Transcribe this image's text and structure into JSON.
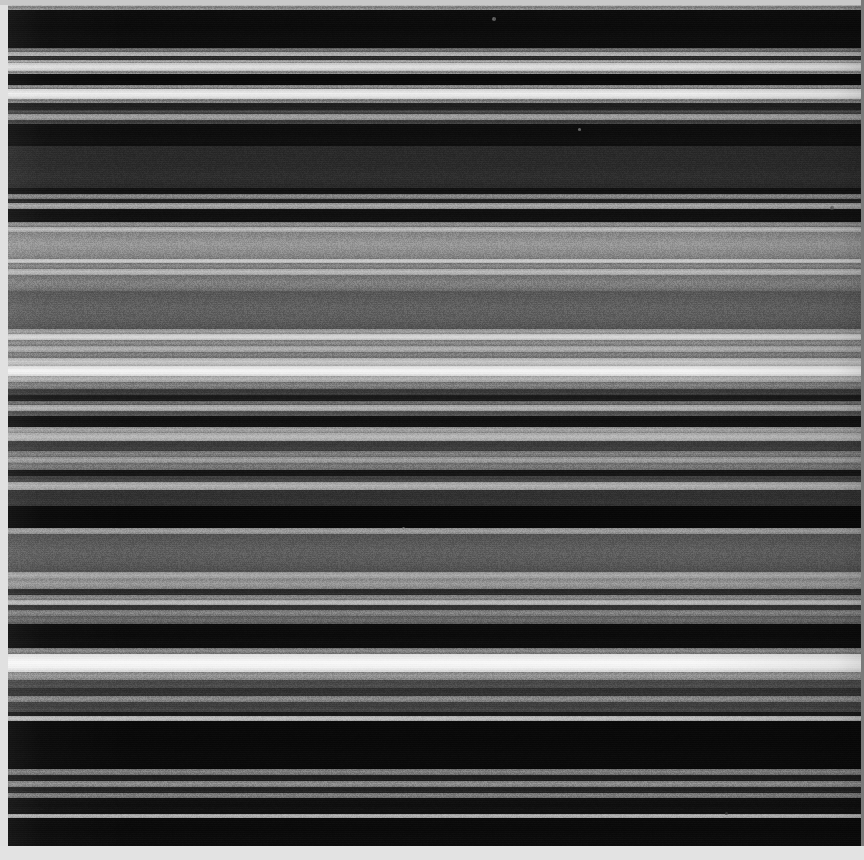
{
  "figure": {
    "width": 864,
    "height": 860,
    "background_color": "#dcdcdc",
    "plate_inset": {
      "left": 8,
      "top": 5,
      "right": 3,
      "bottom": 14
    },
    "mat_colors": {
      "left": "#e1e1e1",
      "top": "#c9c9c9",
      "right": "#7a7a7a",
      "bottom": "#e3e3e3"
    }
  },
  "chart_data": {
    "type": "heatmap",
    "subtitle": "",
    "xlabel": "",
    "ylabel": "",
    "orientation": "horizontal-bands",
    "colormap": "grayscale",
    "value_range": [
      0,
      255
    ],
    "grid": false,
    "legend": "none",
    "axis_ranges": {
      "x": [
        0,
        864
      ],
      "y": [
        0,
        860
      ]
    },
    "note": "Each band is a constant-intensity horizontal stripe; y is pixel row, value is 8-bit gray level.",
    "bands": [
      {
        "y": 0,
        "h": 6,
        "gray": 201,
        "gray2": 188
      },
      {
        "y": 6,
        "h": 4,
        "gray": 150,
        "gray2": 120
      },
      {
        "y": 10,
        "h": 38,
        "gray": 12,
        "gray2": 9
      },
      {
        "y": 48,
        "h": 4,
        "gray": 96,
        "gray2": 118
      },
      {
        "y": 52,
        "h": 4,
        "gray": 181,
        "gray2": 170
      },
      {
        "y": 56,
        "h": 4,
        "gray": 38,
        "gray2": 44
      },
      {
        "y": 60,
        "h": 3,
        "gray": 150,
        "gray2": 168
      },
      {
        "y": 63,
        "h": 8,
        "gray": 214,
        "gray2": 226
      },
      {
        "y": 71,
        "h": 3,
        "gray": 150,
        "gray2": 120
      },
      {
        "y": 74,
        "h": 11,
        "gray": 10,
        "gray2": 8
      },
      {
        "y": 85,
        "h": 4,
        "gray": 120,
        "gray2": 150
      },
      {
        "y": 89,
        "h": 10,
        "gray": 228,
        "gray2": 238
      },
      {
        "y": 99,
        "h": 4,
        "gray": 140,
        "gray2": 110
      },
      {
        "y": 103,
        "h": 7,
        "gray": 34,
        "gray2": 28
      },
      {
        "y": 110,
        "h": 4,
        "gray": 60,
        "gray2": 80
      },
      {
        "y": 114,
        "h": 6,
        "gray": 150,
        "gray2": 162
      },
      {
        "y": 120,
        "h": 4,
        "gray": 70,
        "gray2": 50
      },
      {
        "y": 124,
        "h": 22,
        "gray": 14,
        "gray2": 11
      },
      {
        "y": 146,
        "h": 42,
        "gray": 44,
        "gray2": 40
      },
      {
        "y": 188,
        "h": 6,
        "gray": 18,
        "gray2": 15
      },
      {
        "y": 194,
        "h": 5,
        "gray": 120,
        "gray2": 142
      },
      {
        "y": 199,
        "h": 4,
        "gray": 38,
        "gray2": 30
      },
      {
        "y": 203,
        "h": 6,
        "gray": 152,
        "gray2": 168
      },
      {
        "y": 209,
        "h": 13,
        "gray": 16,
        "gray2": 13
      },
      {
        "y": 222,
        "h": 5,
        "gray": 124,
        "gray2": 148
      },
      {
        "y": 227,
        "h": 5,
        "gray": 176,
        "gray2": 190
      },
      {
        "y": 232,
        "h": 27,
        "gray": 140,
        "gray2": 152
      },
      {
        "y": 259,
        "h": 4,
        "gray": 196,
        "gray2": 206
      },
      {
        "y": 263,
        "h": 6,
        "gray": 124,
        "gray2": 136
      },
      {
        "y": 269,
        "h": 6,
        "gray": 176,
        "gray2": 188
      },
      {
        "y": 275,
        "h": 16,
        "gray": 120,
        "gray2": 128
      },
      {
        "y": 291,
        "h": 38,
        "gray": 92,
        "gray2": 96
      },
      {
        "y": 329,
        "h": 5,
        "gray": 150,
        "gray2": 160
      },
      {
        "y": 334,
        "h": 6,
        "gray": 208,
        "gray2": 218
      },
      {
        "y": 340,
        "h": 6,
        "gray": 128,
        "gray2": 140
      },
      {
        "y": 346,
        "h": 6,
        "gray": 168,
        "gray2": 178
      },
      {
        "y": 352,
        "h": 6,
        "gray": 118,
        "gray2": 130
      },
      {
        "y": 358,
        "h": 8,
        "gray": 188,
        "gray2": 200
      },
      {
        "y": 366,
        "h": 10,
        "gray": 238,
        "gray2": 246
      },
      {
        "y": 376,
        "h": 6,
        "gray": 170,
        "gray2": 180
      },
      {
        "y": 382,
        "h": 7,
        "gray": 120,
        "gray2": 130
      },
      {
        "y": 389,
        "h": 6,
        "gray": 62,
        "gray2": 54
      },
      {
        "y": 395,
        "h": 6,
        "gray": 28,
        "gray2": 22
      },
      {
        "y": 401,
        "h": 4,
        "gray": 96,
        "gray2": 112
      },
      {
        "y": 405,
        "h": 6,
        "gray": 170,
        "gray2": 182
      },
      {
        "y": 411,
        "h": 5,
        "gray": 86,
        "gray2": 72
      },
      {
        "y": 416,
        "h": 11,
        "gray": 18,
        "gray2": 14
      },
      {
        "y": 427,
        "h": 6,
        "gray": 150,
        "gray2": 164
      },
      {
        "y": 433,
        "h": 8,
        "gray": 176,
        "gray2": 186
      },
      {
        "y": 441,
        "h": 10,
        "gray": 64,
        "gray2": 56
      },
      {
        "y": 451,
        "h": 6,
        "gray": 116,
        "gray2": 130
      },
      {
        "y": 457,
        "h": 6,
        "gray": 150,
        "gray2": 162
      },
      {
        "y": 463,
        "h": 7,
        "gray": 112,
        "gray2": 122
      },
      {
        "y": 470,
        "h": 6,
        "gray": 22,
        "gray2": 18
      },
      {
        "y": 476,
        "h": 6,
        "gray": 70,
        "gray2": 60
      },
      {
        "y": 482,
        "h": 8,
        "gray": 166,
        "gray2": 178
      },
      {
        "y": 490,
        "h": 16,
        "gray": 52,
        "gray2": 46
      },
      {
        "y": 506,
        "h": 22,
        "gray": 8,
        "gray2": 6
      },
      {
        "y": 528,
        "h": 6,
        "gray": 150,
        "gray2": 160
      },
      {
        "y": 534,
        "h": 38,
        "gray": 88,
        "gray2": 94
      },
      {
        "y": 572,
        "h": 7,
        "gray": 158,
        "gray2": 170
      },
      {
        "y": 579,
        "h": 10,
        "gray": 142,
        "gray2": 154
      },
      {
        "y": 589,
        "h": 6,
        "gray": 44,
        "gray2": 38
      },
      {
        "y": 595,
        "h": 5,
        "gray": 126,
        "gray2": 138
      },
      {
        "y": 600,
        "h": 5,
        "gray": 178,
        "gray2": 188
      },
      {
        "y": 605,
        "h": 5,
        "gray": 54,
        "gray2": 46
      },
      {
        "y": 610,
        "h": 6,
        "gray": 122,
        "gray2": 134
      },
      {
        "y": 616,
        "h": 8,
        "gray": 96,
        "gray2": 106
      },
      {
        "y": 624,
        "h": 24,
        "gray": 12,
        "gray2": 9
      },
      {
        "y": 648,
        "h": 6,
        "gray": 120,
        "gray2": 140
      },
      {
        "y": 654,
        "h": 18,
        "gray": 242,
        "gray2": 250
      },
      {
        "y": 672,
        "h": 8,
        "gray": 140,
        "gray2": 152
      },
      {
        "y": 680,
        "h": 8,
        "gray": 78,
        "gray2": 70
      },
      {
        "y": 688,
        "h": 8,
        "gray": 52,
        "gray2": 46
      },
      {
        "y": 696,
        "h": 6,
        "gray": 128,
        "gray2": 140
      },
      {
        "y": 702,
        "h": 10,
        "gray": 70,
        "gray2": 60
      },
      {
        "y": 712,
        "h": 4,
        "gray": 26,
        "gray2": 22
      },
      {
        "y": 716,
        "h": 5,
        "gray": 180,
        "gray2": 192
      },
      {
        "y": 721,
        "h": 48,
        "gray": 9,
        "gray2": 7
      },
      {
        "y": 769,
        "h": 6,
        "gray": 118,
        "gray2": 130
      },
      {
        "y": 775,
        "h": 6,
        "gray": 30,
        "gray2": 26
      },
      {
        "y": 781,
        "h": 6,
        "gray": 130,
        "gray2": 142
      },
      {
        "y": 787,
        "h": 6,
        "gray": 36,
        "gray2": 30
      },
      {
        "y": 793,
        "h": 5,
        "gray": 116,
        "gray2": 128
      },
      {
        "y": 798,
        "h": 16,
        "gray": 16,
        "gray2": 12
      },
      {
        "y": 814,
        "h": 4,
        "gray": 168,
        "gray2": 180
      },
      {
        "y": 818,
        "h": 28,
        "gray": 10,
        "gray2": 8
      }
    ],
    "specks": [
      {
        "x": 492,
        "y": 17,
        "r": 2,
        "gray": 120
      },
      {
        "x": 578,
        "y": 128,
        "r": 1.5,
        "gray": 140
      },
      {
        "x": 830,
        "y": 206,
        "r": 2,
        "gray": 90
      },
      {
        "x": 193,
        "y": 240,
        "r": 1.5,
        "gray": 170
      },
      {
        "x": 402,
        "y": 527,
        "r": 1.5,
        "gray": 130
      },
      {
        "x": 725,
        "y": 812,
        "r": 1.5,
        "gray": 60
      }
    ]
  }
}
